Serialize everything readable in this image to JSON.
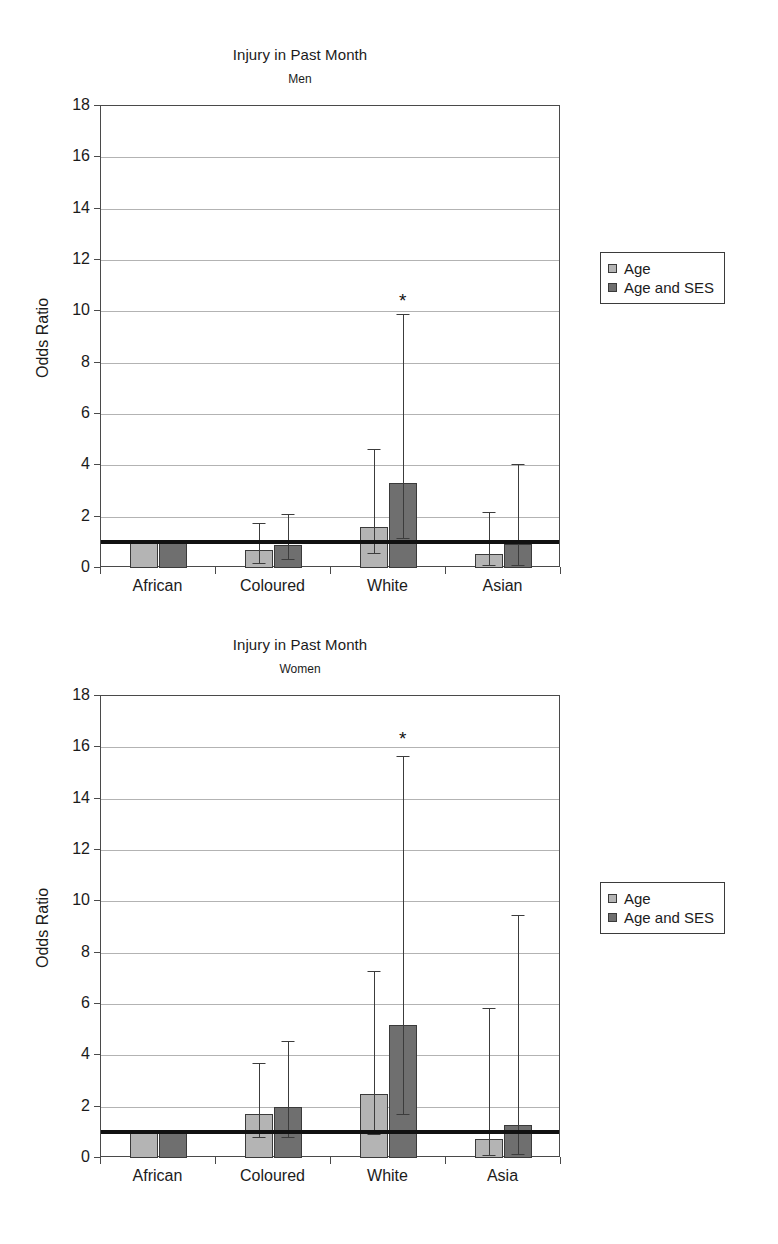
{
  "page": {
    "background": "#ffffff",
    "width": 778,
    "height": 1244
  },
  "palette": {
    "series_age": "#b4b4b4",
    "series_age_ses": "#6f6f6f",
    "axis": "#4a4a4a",
    "grid": "#9a9a9a",
    "reference_line": "#111111",
    "text": "#1b1b1b"
  },
  "legend": {
    "position": "right-middle",
    "entries": [
      {
        "label": "Age",
        "color": "#b4b4b4"
      },
      {
        "label": "Age and SES",
        "color": "#6f6f6f"
      }
    ]
  },
  "chart_data": [
    {
      "id": "men",
      "type": "bar",
      "title": "Injury in Past Month",
      "subtitle": "Men",
      "xlabel": "",
      "ylabel": "Odds Ratio",
      "ylim": [
        0,
        18
      ],
      "yticks": [
        0,
        2,
        4,
        6,
        8,
        10,
        12,
        14,
        16,
        18
      ],
      "grid": true,
      "reference_line": 1,
      "categories": [
        "African",
        "Coloured",
        "White",
        "Asian"
      ],
      "series": [
        {
          "name": "Age",
          "color": "#b4b4b4",
          "values": [
            1.0,
            0.7,
            1.6,
            0.55
          ],
          "ci_low": [
            null,
            0.2,
            0.6,
            0.1
          ],
          "ci_high": [
            null,
            1.75,
            4.65,
            2.2
          ]
        },
        {
          "name": "Age and SES",
          "color": "#6f6f6f",
          "values": [
            1.0,
            0.9,
            3.3,
            0.95
          ],
          "ci_low": [
            null,
            0.35,
            1.15,
            0.1
          ],
          "ci_high": [
            null,
            2.1,
            9.9,
            4.05
          ]
        }
      ],
      "annotations": [
        {
          "text": "*",
          "category": "White",
          "series": "Age and SES",
          "y": 10.5
        }
      ]
    },
    {
      "id": "women",
      "type": "bar",
      "title": "Injury in Past Month",
      "subtitle": "Women",
      "xlabel": "",
      "ylabel": "Odds Ratio",
      "ylim": [
        0,
        18
      ],
      "yticks": [
        0,
        2,
        4,
        6,
        8,
        10,
        12,
        14,
        16,
        18
      ],
      "grid": true,
      "reference_line": 1,
      "categories": [
        "African",
        "Coloured",
        "White",
        "Asia"
      ],
      "series": [
        {
          "name": "Age",
          "color": "#b4b4b4",
          "values": [
            1.0,
            1.7,
            2.5,
            0.75
          ],
          "ci_low": [
            null,
            0.8,
            0.95,
            0.1
          ],
          "ci_high": [
            null,
            3.7,
            7.3,
            5.85
          ]
        },
        {
          "name": "Age and SES",
          "color": "#6f6f6f",
          "values": [
            1.0,
            2.0,
            5.2,
            1.3
          ],
          "ci_low": [
            null,
            0.8,
            1.7,
            0.15
          ],
          "ci_high": [
            null,
            4.55,
            15.65,
            9.45
          ]
        }
      ],
      "annotations": [
        {
          "text": "*",
          "category": "White",
          "series": "Age and SES",
          "y": 16.4
        }
      ]
    }
  ]
}
